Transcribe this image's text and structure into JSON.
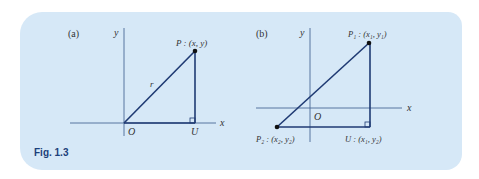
{
  "figure": {
    "caption": "Fig. 1.3",
    "background_color": "#d6e8f7",
    "line_color": "#1f3a73",
    "axis_color": "#4a6a95",
    "caption_color": "#1c3f7a"
  },
  "panel_a": {
    "label": "(a)",
    "x_axis_label": "x",
    "y_axis_label": "y",
    "origin_label": "O",
    "point_label": "P : (x, y)",
    "foot_label": "U",
    "hypotenuse_label": "r"
  },
  "panel_b": {
    "label": "(b)",
    "x_axis_label": "x",
    "y_axis_label": "y",
    "origin_label": "O",
    "p1_label": "P₁ : (x₁, y₁)",
    "p2_label": "P₂ : (x₂, y₂)",
    "u_label": "U : (x₁, y₂)"
  }
}
